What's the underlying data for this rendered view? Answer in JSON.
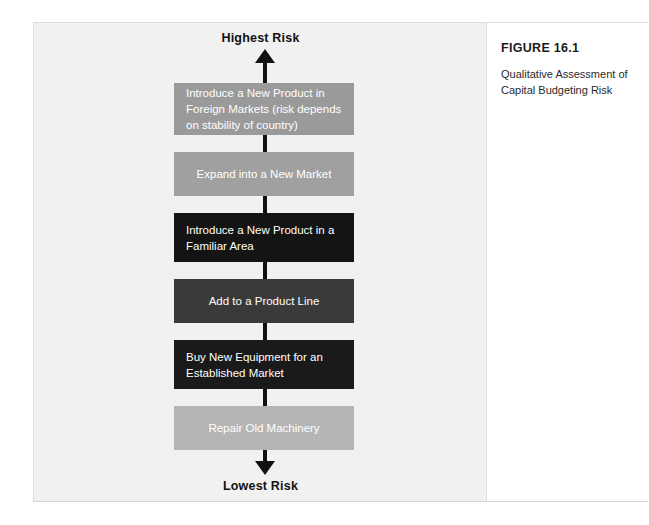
{
  "figure": {
    "number": "FIGURE 16.1",
    "caption": "Qualitative Assessment of Capital Budgeting Risk"
  },
  "diagram": {
    "top_label": "Highest Risk",
    "bottom_label": "Lowest Risk",
    "axis_color": "#111111",
    "panel_background": "#f1f1f1",
    "boxes": [
      {
        "label": "Introduce a New Product in Foreign Markets (risk depends on stability of country)",
        "color": "#9a9a9a",
        "text_color": "#ffffff",
        "align": "left",
        "top": 60,
        "height": 52
      },
      {
        "label": "Expand into a New Market",
        "color": "#a0a0a0",
        "text_color": "#ffffff",
        "align": "center",
        "top": 129,
        "height": 44
      },
      {
        "label": "Introduce a New Product in a Familiar Area",
        "color": "#141414",
        "text_color": "#ffffff",
        "align": "left",
        "top": 190,
        "height": 49
      },
      {
        "label": "Add to a Product Line",
        "color": "#3a3a3a",
        "text_color": "#ffffff",
        "align": "center",
        "top": 256,
        "height": 44
      },
      {
        "label": "Buy New Equipment for an Established Market",
        "color": "#1a1a1a",
        "text_color": "#ffffff",
        "align": "left",
        "top": 317,
        "height": 49
      },
      {
        "label": "Repair Old Machinery",
        "color": "#b5b5b5",
        "text_color": "#ffffff",
        "align": "center",
        "top": 383,
        "height": 44
      }
    ]
  }
}
